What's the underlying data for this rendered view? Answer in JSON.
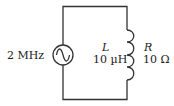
{
  "diagram": {
    "type": "circuit",
    "source": {
      "label": "2 MHz",
      "symbol": "ac-source"
    },
    "inductor": {
      "symbol_label": "L",
      "value": "10 µH"
    },
    "resistor": {
      "symbol_label": "R",
      "value": "10 Ω"
    },
    "colors": {
      "wire": "#333333",
      "text": "#222222",
      "background": "#ffffff"
    }
  }
}
